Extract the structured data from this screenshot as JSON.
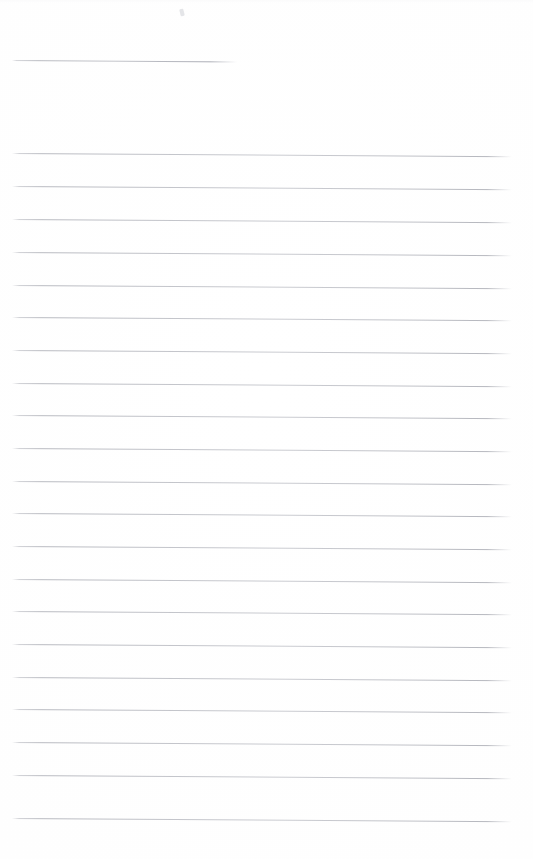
{
  "document": {
    "kind": "scanned-ruled-paper",
    "title": "Blank ruled notebook page",
    "description": "A scanned blank sheet of ruled (lined) paper with no handwriting or printed text.",
    "page_width": 533,
    "page_height": 859,
    "background_color": "#ffffff",
    "rule_color": "#aaacb4",
    "rule_thickness_px": 1,
    "rule_spacing_px": 32.7,
    "rule_tilt_degrees": 0.38,
    "margin_left_px": 12,
    "margin_right_px": 512,
    "visible_text": "",
    "handwriting_present": "no",
    "notes_count": "0"
  },
  "rules": [
    {
      "id": "rule-0",
      "y": 60,
      "x_start": 12,
      "x_end": 237,
      "variant": "short"
    },
    {
      "id": "rule-1",
      "y": 153,
      "x_start": 12,
      "x_end": 512,
      "variant": "full"
    },
    {
      "id": "rule-2",
      "y": 186,
      "x_start": 12,
      "x_end": 512,
      "variant": "full"
    },
    {
      "id": "rule-3",
      "y": 219,
      "x_start": 12,
      "x_end": 512,
      "variant": "full"
    },
    {
      "id": "rule-4",
      "y": 252,
      "x_start": 12,
      "x_end": 512,
      "variant": "full"
    },
    {
      "id": "rule-5",
      "y": 285,
      "x_start": 12,
      "x_end": 512,
      "variant": "full"
    },
    {
      "id": "rule-6",
      "y": 317,
      "x_start": 12,
      "x_end": 512,
      "variant": "full"
    },
    {
      "id": "rule-7",
      "y": 350,
      "x_start": 12,
      "x_end": 512,
      "variant": "full"
    },
    {
      "id": "rule-8",
      "y": 383,
      "x_start": 12,
      "x_end": 512,
      "variant": "full"
    },
    {
      "id": "rule-9",
      "y": 415,
      "x_start": 12,
      "x_end": 512,
      "variant": "full"
    },
    {
      "id": "rule-10",
      "y": 448,
      "x_start": 12,
      "x_end": 512,
      "variant": "full"
    },
    {
      "id": "rule-11",
      "y": 481,
      "x_start": 12,
      "x_end": 512,
      "variant": "full"
    },
    {
      "id": "rule-12",
      "y": 513,
      "x_start": 12,
      "x_end": 512,
      "variant": "full"
    },
    {
      "id": "rule-13",
      "y": 546,
      "x_start": 12,
      "x_end": 512,
      "variant": "full"
    },
    {
      "id": "rule-14",
      "y": 579,
      "x_start": 12,
      "x_end": 512,
      "variant": "full"
    },
    {
      "id": "rule-15",
      "y": 611,
      "x_start": 12,
      "x_end": 512,
      "variant": "full"
    },
    {
      "id": "rule-16",
      "y": 644,
      "x_start": 12,
      "x_end": 512,
      "variant": "full"
    },
    {
      "id": "rule-17",
      "y": 677,
      "x_start": 12,
      "x_end": 512,
      "variant": "full"
    },
    {
      "id": "rule-18",
      "y": 709,
      "x_start": 12,
      "x_end": 512,
      "variant": "full"
    },
    {
      "id": "rule-19",
      "y": 742,
      "x_start": 12,
      "x_end": 512,
      "variant": "full"
    },
    {
      "id": "rule-20",
      "y": 775,
      "x_start": 12,
      "x_end": 512,
      "variant": "full"
    },
    {
      "id": "rule-21",
      "y": 818,
      "x_start": 12,
      "x_end": 512,
      "variant": "full"
    }
  ],
  "artifacts": [
    {
      "id": "speck-1",
      "x": 180,
      "y": 9,
      "kind": "scan-speck"
    }
  ]
}
